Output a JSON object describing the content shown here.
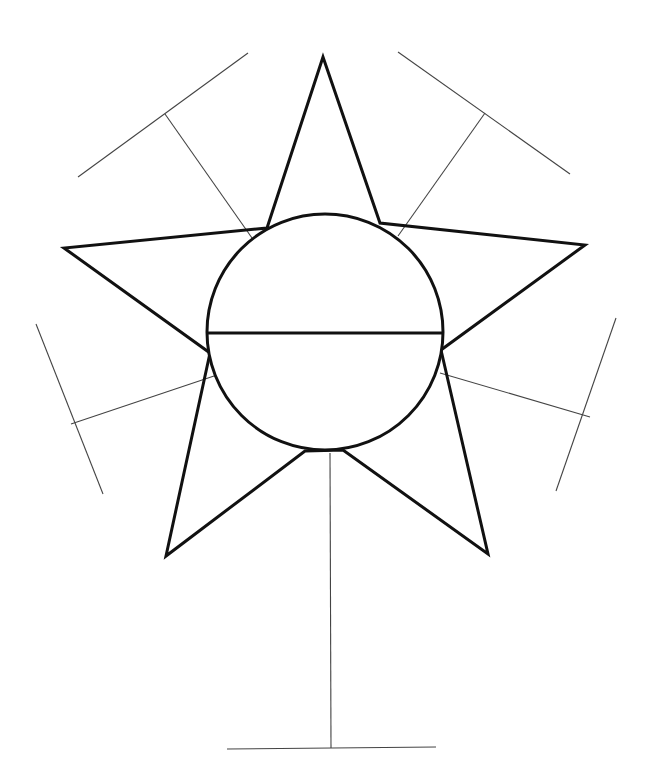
{
  "diagram": {
    "type": "star-graphic-organizer",
    "background": "#ffffff",
    "stroke_color": "#111111",
    "thin_stroke_color": "#444444",
    "circle": {
      "cx": 325,
      "cy": 332,
      "r": 118,
      "divider_y": 333
    },
    "star_points": {
      "top": [
        323,
        57
      ],
      "right": [
        585,
        245
      ],
      "bottom_right": [
        488,
        554
      ],
      "bottom_left": [
        166,
        556
      ],
      "left": [
        64,
        248
      ]
    },
    "star_inner": {
      "top_left": [
        267,
        228
      ],
      "top_right": [
        380,
        223
      ],
      "right": [
        441,
        350
      ],
      "bottom_right": [
        343,
        450
      ],
      "bottom_left": [
        305,
        451
      ],
      "left": [
        210,
        353
      ]
    },
    "writing_lines": [
      {
        "name": "upper-left",
        "stem": [
          [
            252,
            238
          ],
          [
            165,
            114
          ]
        ],
        "bar": [
          [
            78,
            177
          ],
          [
            248,
            53
          ]
        ]
      },
      {
        "name": "upper-right",
        "stem": [
          [
            398,
            236
          ],
          [
            485,
            113
          ]
        ],
        "bar": [
          [
            398,
            52
          ],
          [
            570,
            174
          ]
        ]
      },
      {
        "name": "lower-left",
        "stem": [
          [
            214,
            376
          ],
          [
            71,
            424
          ]
        ],
        "bar": [
          [
            36,
            324
          ],
          [
            103,
            494
          ]
        ]
      },
      {
        "name": "lower-right",
        "stem": [
          [
            440,
            373
          ],
          [
            590,
            417
          ]
        ],
        "bar": [
          [
            616,
            318
          ],
          [
            556,
            491
          ]
        ]
      },
      {
        "name": "bottom",
        "stem": [
          [
            330,
            453
          ],
          [
            331,
            748
          ]
        ],
        "bar": [
          [
            227,
            749
          ],
          [
            436,
            747
          ]
        ]
      }
    ]
  }
}
